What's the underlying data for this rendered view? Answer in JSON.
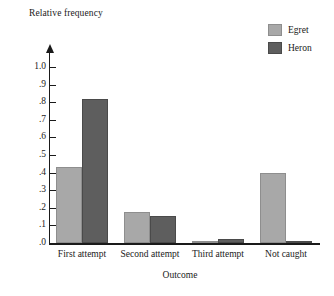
{
  "chart_data": {
    "type": "bar",
    "title": "",
    "ylabel": "Relative frequency",
    "xlabel": "Outcome",
    "categories": [
      "First attempt",
      "Second attempt",
      "Third attempt",
      "Not caught"
    ],
    "series": [
      {
        "name": "Egret",
        "color": "#a8a8a8",
        "values": [
          0.43,
          0.175,
          0.01,
          0.4
        ]
      },
      {
        "name": "Heron",
        "color": "#5e5e5e",
        "values": [
          0.82,
          0.155,
          0.02,
          0.01
        ]
      }
    ],
    "ylim": [
      0,
      1.0
    ],
    "ytick_labels": [
      "1.0",
      ".9",
      ".8",
      ".7",
      ".6",
      ".5",
      ".4",
      ".3",
      ".2",
      ".1",
      ".0"
    ],
    "ytick_values": [
      1.0,
      0.9,
      0.8,
      0.7,
      0.6,
      0.5,
      0.4,
      0.3,
      0.2,
      0.1,
      0.0
    ],
    "grid": false,
    "legend_position": "top-right",
    "legend_entries": [
      "Egret",
      "Heron"
    ]
  }
}
